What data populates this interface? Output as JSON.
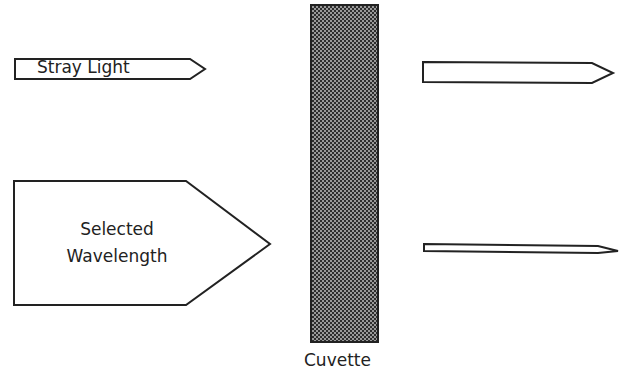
{
  "diagram": {
    "inputs": {
      "stray_light": {
        "label": "Stray Light"
      },
      "selected_wavelength": {
        "line1": "Selected",
        "line2": "Wavelength"
      }
    },
    "sample": {
      "label": "Cuvette"
    },
    "outputs": [
      {
        "name": "stray-light-output-arrow",
        "description": "transmitted stray light (unattenuated)"
      },
      {
        "name": "selected-wavelength-output-arrow",
        "description": "transmitted selected wavelength (attenuated)"
      }
    ],
    "colors": {
      "outline": "#222222",
      "fill": "#ffffff",
      "cuvette_dark": "#3a3a3a",
      "cuvette_light": "#9a9a9a"
    }
  }
}
